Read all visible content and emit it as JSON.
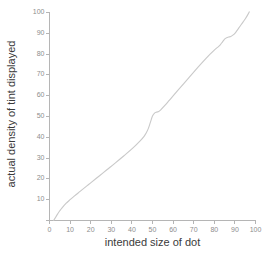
{
  "chart_data": {
    "type": "line",
    "title": "",
    "xlabel": "intended size of dot",
    "ylabel": "actual density of tint displayed",
    "xlim": [
      0,
      100
    ],
    "ylim": [
      0,
      100
    ],
    "grid": false,
    "legend": null,
    "line_color": "#c9c9c9",
    "axis_color": "#b5b5b5",
    "tick_label_color": "#8d8d8d",
    "title_color": "#3a3a3a",
    "background": "#ffffff",
    "xticks": [
      0,
      10,
      20,
      30,
      40,
      50,
      60,
      70,
      80,
      90,
      100
    ],
    "xtick_labels": [
      "0",
      "10",
      "20",
      "30",
      "40",
      "50",
      "60",
      "70",
      "80",
      "90",
      "100"
    ],
    "yticks": [
      0,
      10,
      20,
      30,
      40,
      50,
      60,
      70,
      80,
      90,
      100
    ],
    "ytick_labels": [
      "0",
      "10",
      "20",
      "30",
      "40",
      "50",
      "60",
      "70",
      "80",
      "90",
      "100"
    ],
    "series": [
      {
        "name": "dot gain curve",
        "x": [
          2,
          3,
          4,
          5,
          6,
          8,
          10,
          12,
          15,
          18,
          20,
          24,
          28,
          32,
          36,
          40,
          44,
          46,
          47,
          48,
          49,
          50,
          51,
          52,
          53,
          54,
          56,
          58,
          60,
          64,
          68,
          72,
          76,
          80,
          82,
          83,
          84,
          85,
          86,
          87,
          88,
          89,
          90,
          91,
          92,
          93,
          94,
          95,
          96,
          97
        ],
        "y": [
          0,
          1.6,
          3.2,
          4.7,
          6.0,
          8.2,
          10.0,
          11.7,
          14.1,
          16.5,
          18.1,
          21.3,
          24.5,
          27.7,
          31.0,
          34.4,
          38.3,
          40.6,
          42.2,
          44.3,
          47.3,
          50.2,
          51.6,
          52.1,
          52.4,
          53.2,
          55.3,
          57.6,
          59.9,
          64.5,
          69.1,
          73.6,
          78.0,
          81.9,
          83.6,
          84.6,
          85.9,
          87.2,
          87.9,
          88.2,
          88.5,
          89.1,
          90.0,
          91.3,
          92.7,
          94.1,
          95.5,
          96.9,
          98.5,
          100.3
        ]
      }
    ]
  },
  "axis_title_x": "intended size of dot",
  "axis_title_y": "actual density of tint displayed"
}
